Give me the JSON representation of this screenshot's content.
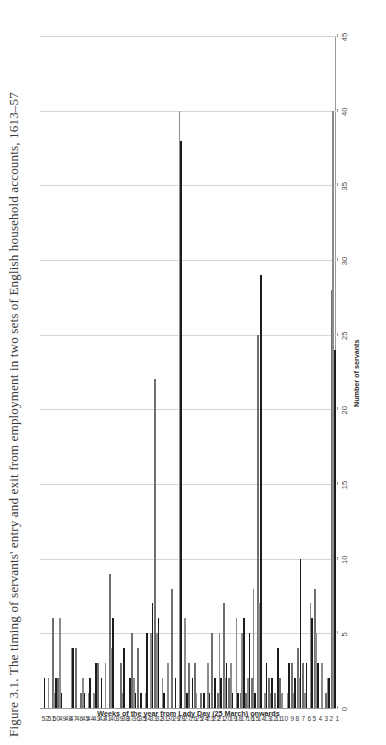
{
  "figure": {
    "caption": "Figure 3.1. The timing of servants' entry and exit from employment in two sets of English household accounts, 1613–57"
  },
  "chart_data": {
    "type": "bar",
    "orientation": "horizontal",
    "title": "",
    "xlabel": "Weeks of the year from Lady Day (25 March) onwards",
    "ylabel": "Number of servants",
    "ylim": [
      0,
      45
    ],
    "yticks": [
      0,
      5,
      10,
      15,
      20,
      25,
      30,
      35,
      40,
      45
    ],
    "grid": true,
    "legend_position": "none",
    "categories": [
      "1",
      "2",
      "3",
      "4",
      "5",
      "6",
      "7",
      "8",
      "9",
      "10",
      "11",
      "12",
      "13",
      "14",
      "15",
      "16",
      "17",
      "18",
      "19",
      "20",
      "21",
      "22",
      "23",
      "24",
      "25",
      "26",
      "27",
      "28",
      "29",
      "30",
      "31",
      "32",
      "33",
      "34",
      "35",
      "36",
      "37",
      "38",
      "39",
      "40",
      "41",
      "42",
      "43",
      "44",
      "45",
      "46",
      "47",
      "48",
      "49",
      "50",
      "51",
      "52"
    ],
    "series": [
      {
        "name": "series-white",
        "fill": "#ffffff",
        "stroke": "#6e6e6e",
        "values": [
          28,
          1,
          0,
          8,
          0,
          3,
          4,
          3,
          0,
          2,
          1,
          2,
          0,
          25,
          2,
          1,
          1,
          0,
          2,
          7,
          1,
          5,
          0,
          1,
          3,
          3,
          0,
          0,
          8,
          0,
          0,
          22,
          0,
          0,
          4,
          5,
          0,
          3,
          0,
          9,
          0,
          3,
          0,
          0,
          1,
          4,
          0,
          0,
          2,
          6,
          0,
          0
        ]
      },
      {
        "name": "series-gray",
        "fill": "#8c8c8c",
        "stroke": "#8c8c8c",
        "values": [
          40,
          2,
          3,
          5,
          7,
          1,
          2,
          1,
          1,
          1,
          0,
          1,
          1,
          7,
          8,
          2,
          5,
          6,
          3,
          2,
          5,
          0,
          3,
          0,
          1,
          0,
          6,
          40,
          0,
          3,
          2,
          5,
          5,
          1,
          0,
          2,
          0,
          1,
          0,
          4,
          3,
          0,
          1,
          1,
          2,
          0,
          4,
          0,
          6,
          1,
          2,
          0
        ]
      },
      {
        "name": "series-black",
        "fill": "#1b1b1b",
        "stroke": "#1b1b1b",
        "values": [
          24,
          2,
          0,
          3,
          6,
          3,
          10,
          2,
          3,
          0,
          4,
          2,
          3,
          29,
          1,
          5,
          6,
          1,
          1,
          3,
          2,
          2,
          1,
          1,
          0,
          2,
          1,
          38,
          2,
          0,
          1,
          6,
          7,
          5,
          1,
          1,
          2,
          4,
          0,
          6,
          0,
          2,
          3,
          2,
          1,
          0,
          4,
          0,
          1,
          2,
          0,
          2
        ]
      }
    ]
  }
}
